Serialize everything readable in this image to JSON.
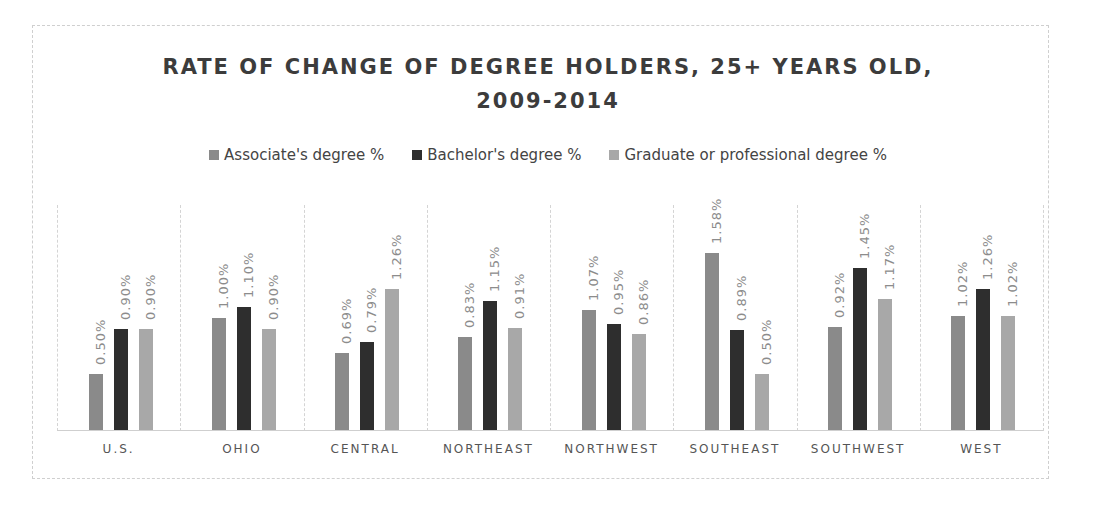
{
  "chart_data": {
    "type": "bar",
    "title": "RATE OF CHANGE OF DEGREE HOLDERS, 25+ YEARS OLD, 2009-2014",
    "title_lines": [
      "RATE OF CHANGE OF DEGREE HOLDERS, 25+ YEARS OLD,",
      "2009-2014"
    ],
    "xlabel": "",
    "ylabel": "",
    "legend_position": "top",
    "grid": false,
    "categories": [
      "U.S.",
      "OHIO",
      "CENTRAL",
      "NORTHEAST",
      "NORTHWEST",
      "SOUTHEAST",
      "SOUTHWEST",
      "WEST"
    ],
    "series": [
      {
        "name": "Associate's degree %",
        "color": "#8a8a8a",
        "values": [
          0.5,
          1.0,
          0.69,
          0.83,
          1.07,
          1.58,
          0.92,
          1.02
        ],
        "labels": [
          "0.50%",
          "1.00%",
          "0.69%",
          "0.83%",
          "1.07%",
          "1.58%",
          "0.92%",
          "1.02%"
        ]
      },
      {
        "name": "Bachelor's degree %",
        "color": "#2e2e2e",
        "values": [
          0.9,
          1.1,
          0.79,
          1.15,
          0.95,
          0.89,
          1.45,
          1.26
        ],
        "labels": [
          "0.90%",
          "1.10%",
          "0.79%",
          "1.15%",
          "0.95%",
          "0.89%",
          "1.45%",
          "1.26%"
        ]
      },
      {
        "name": "Graduate or professional degree %",
        "color": "#a8a8a8",
        "values": [
          0.9,
          0.9,
          1.26,
          0.91,
          0.86,
          0.5,
          1.17,
          1.02
        ],
        "labels": [
          "0.90%",
          "0.90%",
          "1.26%",
          "0.91%",
          "0.86%",
          "0.50%",
          "1.17%",
          "1.02%"
        ]
      }
    ],
    "ylim": [
      0,
      2.0
    ]
  }
}
